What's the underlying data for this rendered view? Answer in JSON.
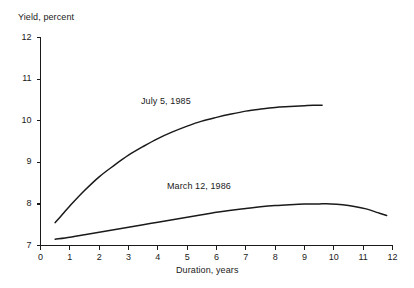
{
  "chart_data": {
    "type": "line",
    "title": "",
    "subtitle": "",
    "xlabel": "Duration, years",
    "ylabel": "Yield, percent",
    "xlim": [
      0,
      12
    ],
    "ylim": [
      7,
      12
    ],
    "xticks": [
      "0",
      "1",
      "2",
      "3",
      "4",
      "5",
      "6",
      "7",
      "8",
      "9",
      "10",
      "11",
      "12"
    ],
    "yticks": [
      "7",
      "8",
      "9",
      "10",
      "11",
      "12"
    ],
    "grid": false,
    "legend_position": "inline-annotation",
    "line_color": "#1a1a1a",
    "background_color": "#ffffff",
    "axis_color": "#1a1a1a",
    "series": [
      {
        "name": "July 5, 1985",
        "label_x": 3.45,
        "label_y": 10.55,
        "x": [
          0.5,
          0.75,
          1.0,
          1.5,
          2.0,
          2.5,
          3.0,
          3.5,
          4.0,
          4.5,
          5.0,
          5.5,
          6.0,
          6.5,
          7.0,
          7.5,
          8.0,
          8.5,
          9.0,
          9.3,
          9.6
        ],
        "values": [
          7.55,
          7.75,
          7.95,
          8.32,
          8.65,
          8.92,
          9.17,
          9.38,
          9.57,
          9.73,
          9.87,
          9.99,
          10.08,
          10.16,
          10.23,
          10.28,
          10.32,
          10.34,
          10.36,
          10.37,
          10.37
        ]
      },
      {
        "name": "March 12, 1986",
        "label_x": 4.35,
        "label_y": 8.62,
        "x": [
          0.5,
          1.0,
          1.5,
          2.0,
          2.5,
          3.0,
          3.5,
          4.0,
          4.5,
          5.0,
          5.5,
          6.0,
          6.5,
          7.0,
          7.5,
          8.0,
          8.5,
          9.0,
          9.5,
          9.9,
          10.3,
          10.7,
          11.1,
          11.5,
          11.8
        ],
        "values": [
          7.15,
          7.2,
          7.26,
          7.32,
          7.38,
          7.44,
          7.5,
          7.56,
          7.62,
          7.68,
          7.74,
          7.8,
          7.85,
          7.89,
          7.93,
          7.96,
          7.98,
          7.995,
          8.0,
          8.0,
          7.98,
          7.94,
          7.88,
          7.79,
          7.72
        ]
      }
    ]
  },
  "axes": {
    "y_title": "Yield, percent",
    "x_title": "Duration, years"
  },
  "labels": {
    "series_0": "July 5, 1985",
    "series_1": "March 12, 1986"
  },
  "ytick_labels": [
    "12",
    "11",
    "10",
    "9",
    "8",
    "7"
  ],
  "xtick_labels": [
    "0",
    "1",
    "2",
    "3",
    "4",
    "5",
    "6",
    "7",
    "8",
    "9",
    "10",
    "11",
    "12"
  ]
}
